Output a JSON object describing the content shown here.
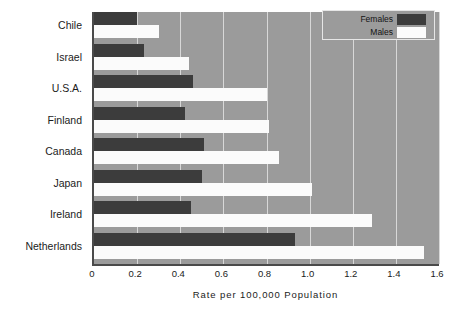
{
  "chart_data": {
    "type": "bar",
    "orientation": "horizontal",
    "title": "",
    "xlabel": "Rate  per  100,000  Population",
    "ylabel": "",
    "xlim": [
      0,
      1.6
    ],
    "xticks": [
      "0",
      "0.2",
      "0.4",
      "0.6",
      "0.8",
      "1.0",
      "1.2",
      "1.4",
      "1.6"
    ],
    "xtick_values": [
      0,
      0.2,
      0.4,
      0.6,
      0.8,
      1.0,
      1.2,
      1.4,
      1.6
    ],
    "grid": true,
    "grid_axis": "x",
    "legend_position": "top-right",
    "categories": [
      "Chile",
      "Israel",
      "U.S.A.",
      "Finland",
      "Canada",
      "Japan",
      "Ireland",
      "Netherlands"
    ],
    "series": [
      {
        "name": "Females",
        "color": "#3c3c3c",
        "values": [
          0.2,
          0.23,
          0.46,
          0.42,
          0.51,
          0.5,
          0.45,
          0.93
        ]
      },
      {
        "name": "Males",
        "color": "#fbfbfb",
        "values": [
          0.3,
          0.44,
          0.8,
          0.81,
          0.86,
          1.01,
          1.29,
          1.53
        ]
      }
    ]
  },
  "legend": {
    "entries": [
      {
        "label": "Females",
        "swatch": "#3c3c3c"
      },
      {
        "label": "Males",
        "swatch": "#fbfbfb"
      }
    ]
  },
  "colors": {
    "plot_background": "#9b9b9b",
    "gridline": "#d8d8d8",
    "axis": "#4a4a4a",
    "female_bar": "#3c3c3c",
    "male_bar": "#fbfbfb",
    "text": "#1b1b1b",
    "page_background": "#ffffff"
  }
}
